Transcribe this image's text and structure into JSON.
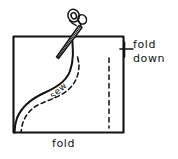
{
  "diagram": {
    "background_color": "#ffffff",
    "ink_color": "#111111",
    "labels": {
      "fold_down_line1": "fold",
      "fold_down_line2": "down",
      "fold_bottom": "fold",
      "sew": "sew"
    },
    "shapes": {
      "fabric_rect": {
        "x": 13,
        "y": 36,
        "width": 111,
        "height": 97,
        "stroke": "#111111"
      },
      "cut_curve": {
        "type": "solid-s-curve",
        "start_x": 72,
        "start_y": 36,
        "end_x": 15,
        "end_y": 132
      },
      "sew_curve": {
        "type": "dashed-s-curve",
        "start_x": 78,
        "start_y": 66,
        "end_x": 22,
        "end_y": 132
      },
      "fold_guide_line": {
        "type": "dashed-vertical",
        "x": 109,
        "y_top": 58,
        "y_bottom": 128
      },
      "needle": {
        "angle_deg": 42,
        "tip_x": 57,
        "tip_y": 56,
        "eye_x": 83,
        "eye_y": 22
      },
      "thread_loops": {
        "count": 2,
        "cx": 75,
        "cy": 16
      },
      "leader": {
        "x_start": 120,
        "x_end": 132,
        "y": 49,
        "tick_height": 14,
        "tick_x": 126
      }
    }
  }
}
